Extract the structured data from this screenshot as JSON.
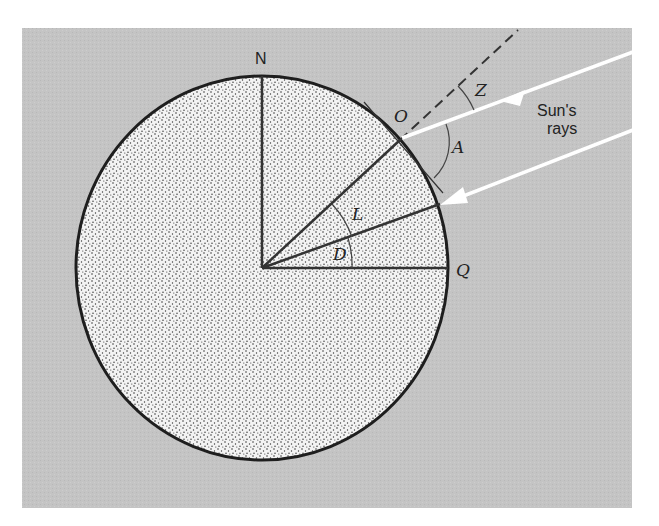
{
  "figure": {
    "colors": {
      "background_panel": "#c4c4c4",
      "earth_fill": "#f3f3f3",
      "earth_stipple": "#3a3a3a",
      "outline": "#222222",
      "sun_rays": "#ffffff"
    },
    "labels": {
      "north": "N",
      "equator_point": "Q",
      "observer": "O",
      "zenith_angle": "Z",
      "altitude_angle": "A",
      "latitude_angle": "L",
      "declination_angle": "D",
      "sun_rays_line1": "Sun's",
      "sun_rays_line2": "rays"
    }
  }
}
